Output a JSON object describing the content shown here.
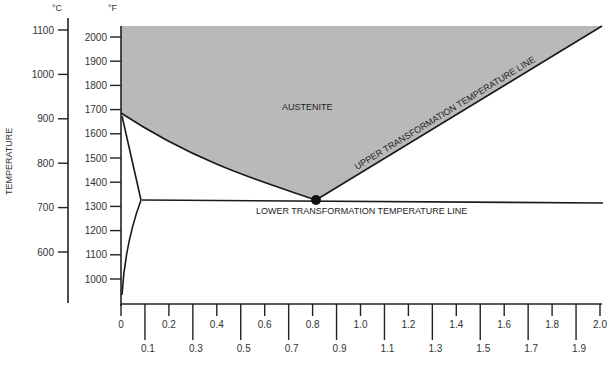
{
  "chart_data": {
    "type": "diagram",
    "title": "",
    "ylabel": "TEMPERATURE",
    "celsius_axis": {
      "unit": "°C",
      "ticks": [
        1100,
        1000,
        900,
        800,
        700,
        600
      ]
    },
    "fahrenheit_axis": {
      "unit": "°F",
      "ticks": [
        2000,
        1900,
        1800,
        1700,
        1600,
        1500,
        1400,
        1300,
        1200,
        1100,
        1000
      ]
    },
    "x_axis": {
      "xlabel": "",
      "range": [
        0,
        2.0
      ],
      "ticks_upper": [
        "0",
        "0.2",
        "0.4",
        "0.6",
        "0.8",
        "1.0",
        "1.2",
        "1.4",
        "1.6",
        "1.8",
        "2.0"
      ],
      "ticks_lower": [
        "0.1",
        "0.3",
        "0.5",
        "0.7",
        "0.9",
        "1.1",
        "1.3",
        "1.5",
        "1.7",
        "1.9"
      ]
    },
    "regions": [
      {
        "name": "AUSTENITE",
        "color": "#b9b9b9"
      }
    ],
    "lines": [
      {
        "name": "UPPER TRANSFORMATION TEMPERATURE LINE",
        "points_carbon_tempF": [
          [
            0.8,
            1333
          ],
          [
            2.0,
            2066
          ]
        ]
      },
      {
        "name": "LOWER TRANSFORMATION TEMPERATURE LINE",
        "points_carbon_tempF": [
          [
            0.1,
            1333
          ],
          [
            2.0,
            1333
          ]
        ]
      },
      {
        "name": "A3 curve",
        "points_carbon_tempF": [
          [
            0,
            1670
          ],
          [
            0.2,
            1560
          ],
          [
            0.4,
            1470
          ],
          [
            0.6,
            1390
          ],
          [
            0.8,
            1333
          ]
        ]
      },
      {
        "name": "ferrite boundary upper",
        "points_carbon_tempF": [
          [
            0,
            1670
          ],
          [
            0.1,
            1333
          ]
        ]
      },
      {
        "name": "ferrite boundary lower",
        "points_carbon_tempF": [
          [
            0.1,
            1333
          ],
          [
            0,
            950
          ]
        ]
      }
    ],
    "eutectoid_point": {
      "carbon": 0.8,
      "tempF": 1333
    },
    "annotations": {
      "austenite": "AUSTENITE",
      "upper_line": "UPPER TRANSFORMATION TEMPERATURE LINE",
      "lower_line": "LOWER TRANSFORMATION TEMPERATURE LINE"
    }
  }
}
